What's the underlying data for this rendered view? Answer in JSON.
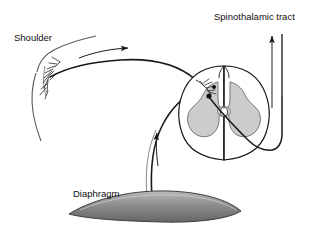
{
  "figure": {
    "type": "anatomical-schematic",
    "background_color": "#ffffff",
    "ink_color": "#1a1a1a"
  },
  "labels": {
    "shoulder": "Shoulder",
    "spinothalamic_tract": "Spinothalamic tract",
    "diaphragm": "Diaphragm"
  },
  "structures": {
    "spinal_cord": {
      "name": "spinal-cord-cross-section",
      "white_matter_fill": "#ffffff",
      "white_matter_stroke": "#1a1a1a",
      "gray_matter_fill": "#cccccc",
      "gray_matter_stroke": "#6e6e6e",
      "central_canal_fill": "#ffffff",
      "central_canal_stroke": "#4a4a4a"
    },
    "diaphragm": {
      "name": "diaphragm-dome",
      "fill_light": "#b4b4b4",
      "fill_dark": "#6b6b6b",
      "stroke": "#3c3c3c"
    },
    "shoulder": {
      "name": "shoulder-skin-contour",
      "stroke": "#4a4a4a",
      "nerve_branch_stroke": "#1a1a1a"
    }
  },
  "pathways": [
    {
      "name": "somatic-afferent-from-shoulder",
      "from": "Shoulder",
      "to": "Dorsal horn",
      "direction": "rightward",
      "arrow": "right"
    },
    {
      "name": "phrenic-afferent-from-diaphragm",
      "from": "Diaphragm",
      "to": "Dorsal horn",
      "direction": "upward",
      "arrow": "up"
    },
    {
      "name": "ascending-spinothalamic-tract",
      "from": "Dorsal horn second-order neuron",
      "to": "Thalamus",
      "direction": "upward",
      "arrow": "up"
    }
  ],
  "markers": {
    "synapse_dots": 2,
    "synapse_fill": "#101010"
  }
}
